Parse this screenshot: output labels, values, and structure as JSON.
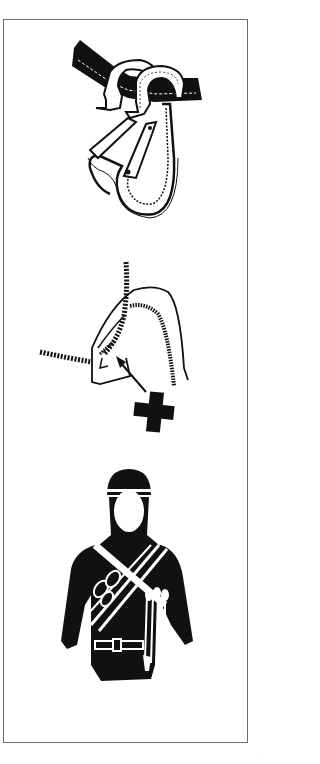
{
  "page": {
    "background": "#ffffff",
    "ink_color": "#111111",
    "frame_color": "#6a6a6a"
  },
  "illustrations": [
    {
      "id": "carabiner",
      "description": "Two carabiners clipped onto a stitched flat sling"
    },
    {
      "id": "wrong",
      "description": "Rope incorrectly clipped through carabiner gate, arrow pointing to it with a cross (wrong) marker"
    },
    {
      "id": "climber",
      "description": "Climber silhouette with helmet wearing a bandolier gear sling with carabiners and belt"
    }
  ],
  "markers": {
    "wrong_symbol": "cross",
    "arrow_direction": "up-left"
  },
  "footer": {
    "page_mark": "··"
  }
}
